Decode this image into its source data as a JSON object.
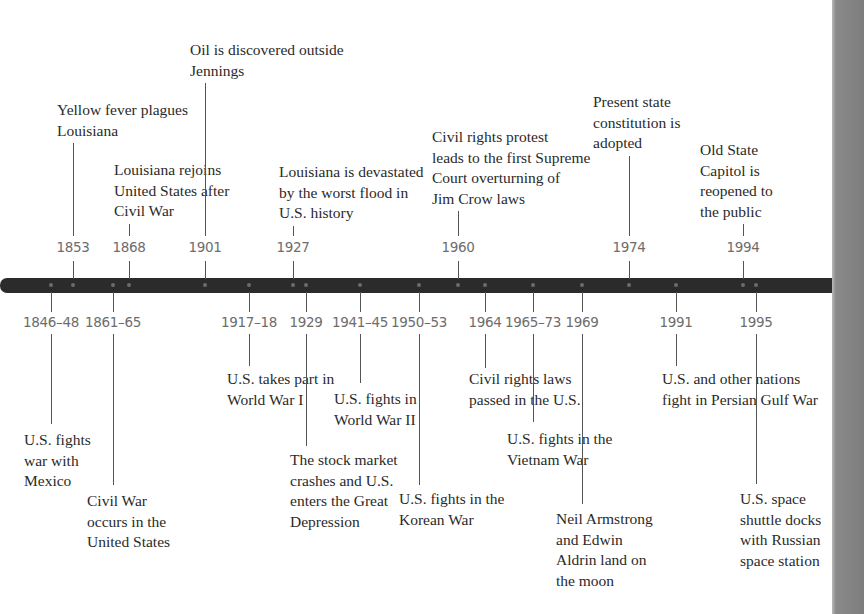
{
  "timeline": {
    "bar_color": "#2b2b2b",
    "year_color": "#6d6d6d",
    "above": [
      {
        "year": "1853",
        "x": 73,
        "event": "Yellow fever plagues\nLouisiana",
        "text_x": 57,
        "text_y": 100,
        "line_top": 138
      },
      {
        "year": "1868",
        "x": 129,
        "event": "Louisiana rejoins\nUnited States after\nCivil War",
        "text_x": 114,
        "text_y": 160,
        "line_top": 218
      },
      {
        "year": "1901",
        "x": 205,
        "event": "Oil is discovered outside\nJennings",
        "text_x": 190,
        "text_y": 40,
        "line_top": 78
      },
      {
        "year": "1927",
        "x": 293,
        "event": "Louisiana is devastated\nby the worst flood in\nU.S. history",
        "text_x": 279,
        "text_y": 162,
        "line_top": 222
      },
      {
        "year": "1960",
        "x": 458,
        "event": "Civil rights protest\nleads to the first Supreme\nCourt overturning of\nJim Crow laws",
        "text_x": 432,
        "text_y": 127,
        "line_top": 200
      },
      {
        "year": "1974",
        "x": 629,
        "event": "Present state\nconstitution is\nadopted",
        "text_x": 593,
        "text_y": 92,
        "line_top": 150
      },
      {
        "year": "1994",
        "x": 743,
        "event": "Old State\nCapitol is\nreopened to\nthe public",
        "text_x": 700,
        "text_y": 140,
        "line_top": 220
      }
    ],
    "below": [
      {
        "year": "1846–48",
        "x": 51,
        "event": "U.S. fights\nwar with\nMexico",
        "text_x": 24,
        "text_y": 430,
        "line_bottom": 424
      },
      {
        "year": "1861–65",
        "x": 113,
        "event": "Civil War\noccurs in the\nUnited States",
        "text_x": 87,
        "text_y": 491,
        "line_bottom": 485
      },
      {
        "year": "1917–18",
        "x": 249,
        "event": "U.S. takes part in\nWorld War I",
        "text_x": 227,
        "text_y": 369,
        "line_bottom": 366
      },
      {
        "year": "1929",
        "x": 306,
        "event": "The stock market\ncrashes and U.S.\nenters the Great\nDepression",
        "text_x": 290,
        "text_y": 450,
        "line_bottom": 446
      },
      {
        "year": "1941–45",
        "x": 360,
        "event": "U.S. fights in\nWorld War II",
        "text_x": 334,
        "text_y": 389,
        "line_bottom": 383
      },
      {
        "year": "1950–53",
        "x": 419,
        "event": "U.S. fights in the\nKorean War",
        "text_x": 399,
        "text_y": 489,
        "line_bottom": 485
      },
      {
        "year": "1964",
        "x": 485,
        "event": "Civil rights laws\npassed in the U.S.",
        "text_x": 469,
        "text_y": 369,
        "line_bottom": 368
      },
      {
        "year": "1965–73",
        "x": 533,
        "event": "U.S. fights in the\nVietnam War",
        "text_x": 507,
        "text_y": 429,
        "line_bottom": 422
      },
      {
        "year": "1969",
        "x": 582,
        "event": "Neil Armstrong\nand Edwin\nAldrin land on\nthe moon",
        "text_x": 556,
        "text_y": 509,
        "line_bottom": 504
      },
      {
        "year": "1991",
        "x": 676,
        "event": "U.S. and other nations\nfight in Persian Gulf War",
        "text_x": 662,
        "text_y": 369,
        "line_bottom": 366
      },
      {
        "year": "1995",
        "x": 756,
        "event": "U.S. space\nshuttle docks\nwith Russian\nspace station",
        "text_x": 740,
        "text_y": 489,
        "line_bottom": 484
      }
    ]
  }
}
